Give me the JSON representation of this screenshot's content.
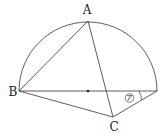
{
  "figure": {
    "type": "geometry-semicircle",
    "stroke_color": "#333333",
    "points": {
      "A": {
        "label": "A",
        "x": 88,
        "y": 21
      },
      "B": {
        "label": "B",
        "x": 19,
        "y": 91
      },
      "C": {
        "label": "C",
        "x": 113,
        "y": 117
      },
      "O": {
        "label": "",
        "x": 88,
        "y": 91
      },
      "D": {
        "label": "",
        "x": 157,
        "y": 91
      }
    },
    "angle_mark": {
      "label": "ア",
      "vertex": "D"
    }
  }
}
